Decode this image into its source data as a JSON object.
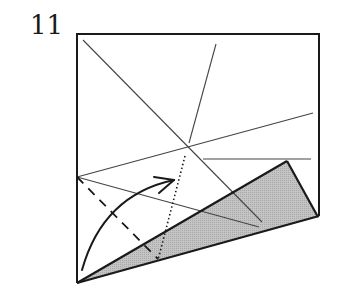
{
  "step": {
    "number": "11"
  },
  "diagram": {
    "colors": {
      "line": "#1a1a1a",
      "crease": "#444444",
      "shade": "#bdbdbd",
      "background": "#ffffff"
    }
  }
}
